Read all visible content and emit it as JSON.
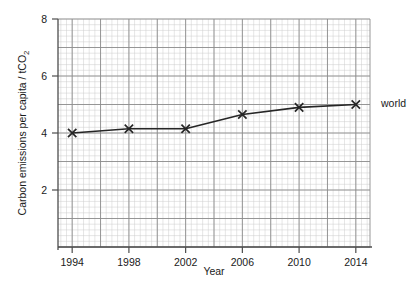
{
  "chart_data": {
    "type": "line",
    "title": "",
    "xlabel": "Year",
    "ylabel_main": "Carbon emissions per capita / tCO",
    "ylabel_sub": "2",
    "xlim": [
      1993,
      2015
    ],
    "ylim": [
      0,
      8
    ],
    "xticks": [
      1994,
      1998,
      2002,
      2006,
      2010,
      2014
    ],
    "xtick_labels": [
      "1994",
      "1998",
      "2002",
      "2006",
      "2010",
      "2014"
    ],
    "yticks": [
      2,
      4,
      6,
      8
    ],
    "ytick_labels": [
      "2",
      "4",
      "6",
      "8"
    ],
    "grid": true,
    "grid_major_step_x": 2,
    "grid_major_step_y": 1,
    "grid_minor_divisions": 5,
    "legend_position": "right-of-axes",
    "series": [
      {
        "name": "world",
        "label": "world",
        "marker": "x",
        "color": "#262626",
        "x": [
          1994,
          1998,
          2002,
          2006,
          2010,
          2014
        ],
        "values": [
          4.0,
          4.15,
          4.15,
          4.65,
          4.9,
          5.0
        ]
      }
    ]
  },
  "colors": {
    "grid_major": "#8c8c8c",
    "grid_minor": "#cdcdcd",
    "axis": "#4d4d4d",
    "line": "#262626",
    "text": "#1a1a1a",
    "background": "#ffffff"
  }
}
